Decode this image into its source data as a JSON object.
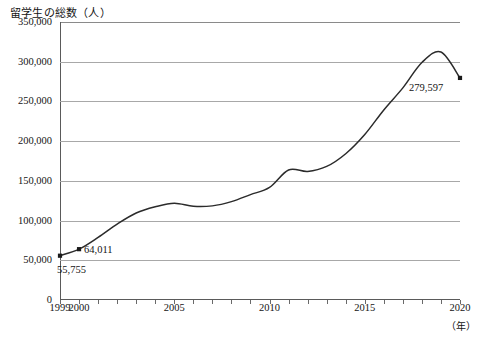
{
  "page": {
    "clipped_top_text": "",
    "background": "#ffffff"
  },
  "chart_data": {
    "type": "line",
    "title": "留学生の総数（人）",
    "xlabel": "（年）",
    "ylabel": "",
    "x": [
      1999,
      2000,
      2001,
      2002,
      2003,
      2004,
      2005,
      2006,
      2007,
      2008,
      2009,
      2010,
      2011,
      2012,
      2013,
      2014,
      2015,
      2016,
      2017,
      2018,
      2019,
      2020
    ],
    "values": [
      55755,
      64011,
      78812,
      95550,
      109508,
      117302,
      121812,
      117927,
      118498,
      123829,
      132720,
      141774,
      163697,
      161848,
      168145,
      184155,
      208379,
      239287,
      267042,
      298980,
      312214,
      279597
    ],
    "categories": [
      "1999",
      "2000",
      "2001",
      "2002",
      "2003",
      "2004",
      "2005",
      "2006",
      "2007",
      "2008",
      "2009",
      "2010",
      "2011",
      "2012",
      "2013",
      "2014",
      "2015",
      "2016",
      "2017",
      "2018",
      "2019",
      "2020"
    ],
    "ylim": [
      0,
      350000
    ],
    "xlim": [
      1999,
      2020
    ],
    "y_ticks": [
      0,
      50000,
      100000,
      150000,
      200000,
      250000,
      300000,
      350000
    ],
    "y_tick_labels": [
      "0",
      "50,000",
      "100,000",
      "150,000",
      "200,000",
      "250,000",
      "300,000",
      "350,000"
    ],
    "x_tick_labels_shown": [
      "1999",
      "2000",
      "2005",
      "2010",
      "2015",
      "2020"
    ],
    "x_ticks_shown_years": [
      1999,
      2000,
      2005,
      2010,
      2015,
      2020
    ],
    "grid": true,
    "grid_axis": "y",
    "legend": false,
    "legend_position": "none",
    "series_color": "#2b2b2b",
    "grid_color": "#a8a8a8",
    "axis_color": "#5a5a5a",
    "annotations": [
      {
        "year": 1999,
        "value": 55755,
        "text": "55,755",
        "position": "below-right"
      },
      {
        "year": 2000,
        "value": 64011,
        "text": "64,011",
        "position": "right"
      },
      {
        "year": 2020,
        "value": 279597,
        "text": "279,597",
        "position": "left"
      }
    ],
    "markers_at_years": [
      1999,
      2000,
      2020
    ]
  }
}
